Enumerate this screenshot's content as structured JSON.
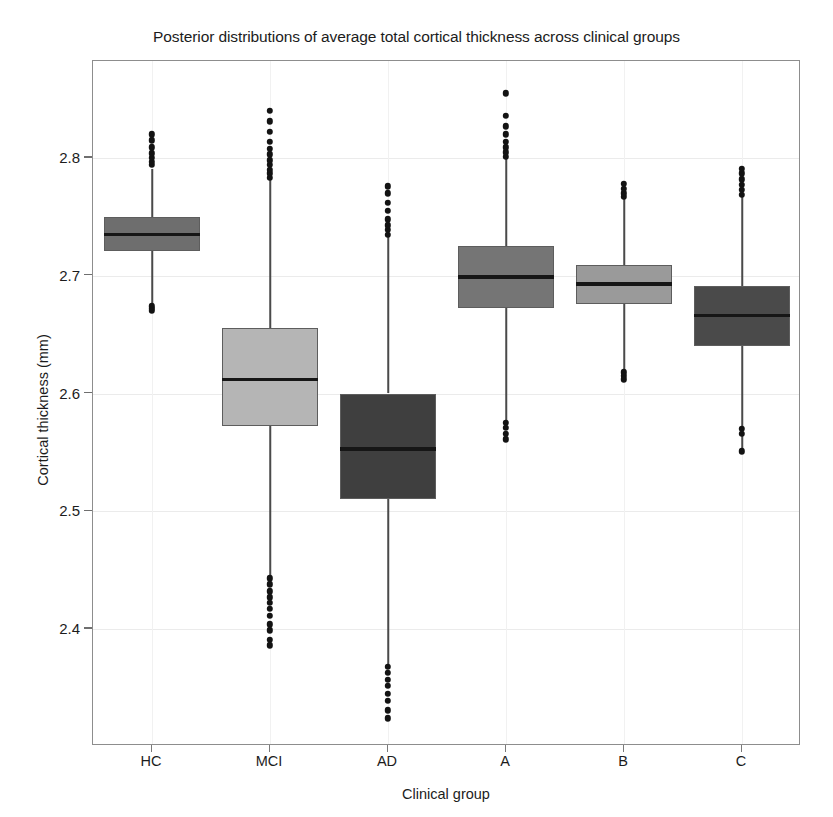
{
  "chart_data": {
    "type": "box",
    "title": "Posterior distributions of average total cortical thickness across clinical groups",
    "xlabel": "Clinical group",
    "ylabel": "Cortical thickness (mm)",
    "categories": [
      "HC",
      "MCI",
      "AD",
      "A",
      "B",
      "C"
    ],
    "ytick_labels": [
      "2.8",
      "2.7",
      "2.6",
      "2.5",
      "2.4"
    ],
    "ytick_values": [
      2.8,
      2.7,
      2.6,
      2.5,
      2.4
    ],
    "ylim": [
      2.318,
      2.9
    ],
    "xlim": [
      0,
      6
    ],
    "grid": "light horizontal and vertical gridlines",
    "legend": "none",
    "series": [
      {
        "name": "HC",
        "color": "#6e6e6e",
        "q1": 2.721,
        "median": 2.735,
        "q3": 2.75,
        "whisker_low": 2.674,
        "whisker_high": 2.791,
        "outliers_high": [
          2.794,
          2.797,
          2.8,
          2.804,
          2.809,
          2.815,
          2.82
        ],
        "outliers_low": [
          2.674,
          2.672,
          2.67
        ]
      },
      {
        "name": "MCI",
        "color": "#b5b5b5",
        "q1": 2.572,
        "median": 2.612,
        "q3": 2.656,
        "whisker_low": 2.445,
        "whisker_high": 2.782,
        "outliers_high": [
          2.783,
          2.787,
          2.79,
          2.794,
          2.798,
          2.803,
          2.808,
          2.814,
          2.822,
          2.831,
          2.84
        ],
        "outliers_low": [
          2.443,
          2.438,
          2.432,
          2.427,
          2.422,
          2.417,
          2.411,
          2.404,
          2.399,
          2.391,
          2.386
        ]
      },
      {
        "name": "AD",
        "color": "#3f3f3f",
        "q1": 2.51,
        "median": 2.553,
        "q3": 2.6,
        "whisker_low": 2.37,
        "whisker_high": 2.733,
        "outliers_high": [
          2.735,
          2.739,
          2.743,
          2.748,
          2.755,
          2.762,
          2.77,
          2.776
        ],
        "outliers_low": [
          2.368,
          2.363,
          2.357,
          2.352,
          2.345,
          2.339,
          2.331,
          2.324
        ]
      },
      {
        "name": "A",
        "color": "#757575",
        "q1": 2.673,
        "median": 2.699,
        "q3": 2.725,
        "whisker_low": 2.577,
        "whisker_high": 2.8,
        "outliers_high": [
          2.801,
          2.805,
          2.809,
          2.814,
          2.82,
          2.827,
          2.836,
          2.855
        ],
        "outliers_low": [
          2.575,
          2.571,
          2.566,
          2.561
        ]
      },
      {
        "name": "B",
        "color": "#9a9a9a",
        "q1": 2.676,
        "median": 2.693,
        "q3": 2.709,
        "whisker_low": 2.619,
        "whisker_high": 2.766,
        "outliers_high": [
          2.767,
          2.77,
          2.774,
          2.778
        ],
        "outliers_low": [
          2.618,
          2.615,
          2.612
        ]
      },
      {
        "name": "C",
        "color": "#4a4a4a",
        "q1": 2.64,
        "median": 2.666,
        "q3": 2.691,
        "whisker_low": 2.552,
        "whisker_high": 2.768,
        "outliers_high": [
          2.769,
          2.773,
          2.777,
          2.782,
          2.787,
          2.791
        ],
        "outliers_low": [
          2.57,
          2.566,
          2.551
        ]
      }
    ]
  }
}
